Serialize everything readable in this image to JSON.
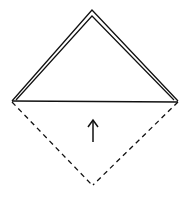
{
  "diagram": {
    "type": "origami-fold-step",
    "colors": {
      "stroke": "#111111",
      "background": "#ffffff"
    },
    "shapes": {
      "outer_triangle": {
        "points": "12,101 92,10 178,101"
      },
      "inner_triangle": {
        "points": "16,100 92,16 174,100"
      },
      "fold_edge": {
        "x1": 12,
        "y1": 101,
        "x2": 178,
        "y2": 102
      },
      "dashed_left": {
        "x1": 12,
        "y1": 102,
        "x2": 92,
        "y2": 185
      },
      "dashed_right": {
        "x1": 178,
        "y1": 102,
        "x2": 93,
        "y2": 185
      },
      "arrow": {
        "direction": "up",
        "shaft": {
          "x1": 93,
          "y1": 142,
          "x2": 93,
          "y2": 121
        },
        "head": "88,127 93,120 98,127"
      }
    }
  }
}
